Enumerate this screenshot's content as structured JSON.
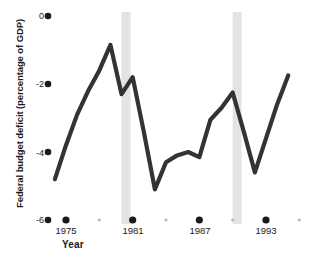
{
  "chart_data": {
    "type": "line",
    "title": "",
    "xlabel": "Year",
    "ylabel": "Federal budget deficit (percentage of GDP)",
    "xlim": [
      1974,
      1996
    ],
    "ylim": [
      -6,
      0
    ],
    "grid": false,
    "legend": null,
    "line_color": "#333333",
    "shaded_band_color": "#e3e3e3",
    "x_major_ticks": [
      1975,
      1981,
      1987,
      1993
    ],
    "x_major_tick_labels": [
      "1975",
      "1981",
      "1987",
      "1993"
    ],
    "x_minor_ticks": [
      1978,
      1984,
      1990,
      1996
    ],
    "y_ticks": [
      0,
      -2,
      -4,
      -6
    ],
    "y_tick_labels": [
      "0",
      "-2",
      "-4",
      "-6"
    ],
    "recession_bands": [
      {
        "start": 1980.0,
        "end": 1980.8
      },
      {
        "start": 1990.0,
        "end": 1990.8
      }
    ],
    "x": [
      1974,
      1975,
      1976,
      1977,
      1978,
      1979,
      1980,
      1981,
      1982,
      1983,
      1984,
      1985,
      1986,
      1987,
      1988,
      1989,
      1990,
      1991,
      1992,
      1993,
      1994,
      1995
    ],
    "values": [
      -4.8,
      -3.8,
      -2.9,
      -2.2,
      -1.6,
      -0.85,
      -2.3,
      -1.8,
      -3.4,
      -5.1,
      -4.3,
      -4.1,
      -4.0,
      -4.15,
      -3.05,
      -2.7,
      -2.25,
      -3.4,
      -4.6,
      -3.6,
      -2.6,
      -1.75
    ],
    "series": [
      {
        "name": "Federal budget deficit",
        "values": [
          -4.8,
          -3.8,
          -2.9,
          -2.2,
          -1.6,
          -0.85,
          -2.3,
          -1.8,
          -3.4,
          -5.1,
          -4.3,
          -4.1,
          -4.0,
          -4.15,
          -3.05,
          -2.7,
          -2.25,
          -3.4,
          -4.6,
          -3.6,
          -2.6,
          -1.75
        ]
      }
    ]
  },
  "axes": {
    "y_title": "Federal budget deficit (percentage of GDP)",
    "x_title": "Year",
    "y_labels": [
      "0",
      "-2",
      "-4",
      "-6"
    ],
    "x_labels": [
      "1975",
      "1981",
      "1987",
      "1993"
    ]
  }
}
